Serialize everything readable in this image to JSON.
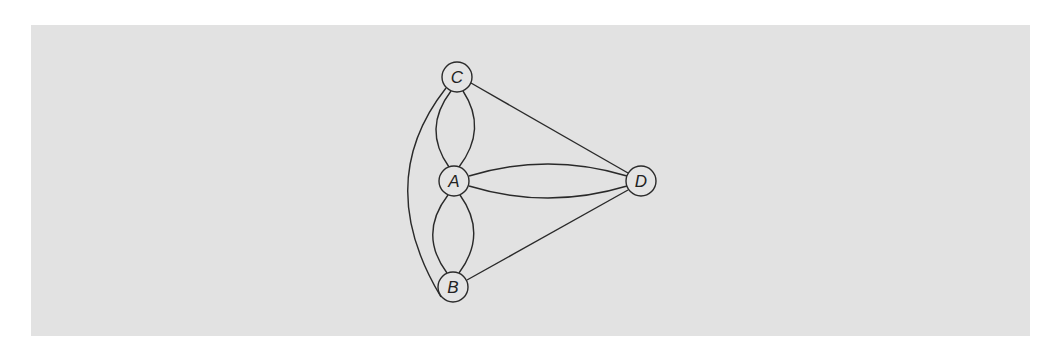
{
  "diagram": {
    "type": "multigraph",
    "nodes": [
      {
        "id": "C",
        "label": "C",
        "x": 457,
        "y": 77
      },
      {
        "id": "A",
        "label": "A",
        "x": 454,
        "y": 181
      },
      {
        "id": "D",
        "label": "D",
        "x": 641,
        "y": 181
      },
      {
        "id": "B",
        "label": "B",
        "x": 453,
        "y": 287
      }
    ],
    "edges": [
      {
        "from": "C",
        "to": "A",
        "count": 2
      },
      {
        "from": "A",
        "to": "B",
        "count": 2
      },
      {
        "from": "A",
        "to": "D",
        "count": 2
      },
      {
        "from": "C",
        "to": "D",
        "count": 1
      },
      {
        "from": "B",
        "to": "D",
        "count": 1
      },
      {
        "from": "C",
        "to": "B",
        "count": 1
      }
    ]
  },
  "colors": {
    "panel": "#e2e2e2",
    "stroke": "#2a2a2a",
    "background": "#ffffff"
  }
}
